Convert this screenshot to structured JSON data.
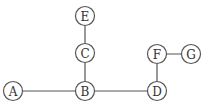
{
  "diagram": {
    "type": "graph",
    "node_radius": 9.5,
    "colors": {
      "stroke": "#555555",
      "text": "#333333",
      "background": "#ffffff"
    },
    "nodes": [
      {
        "id": "E",
        "label": "E",
        "x": 85,
        "y": 16
      },
      {
        "id": "C",
        "label": "C",
        "x": 85,
        "y": 53
      },
      {
        "id": "A",
        "label": "A",
        "x": 13,
        "y": 91
      },
      {
        "id": "B",
        "label": "B",
        "x": 85,
        "y": 91
      },
      {
        "id": "D",
        "label": "D",
        "x": 157,
        "y": 91
      },
      {
        "id": "F",
        "label": "F",
        "x": 157,
        "y": 54
      },
      {
        "id": "G",
        "label": "G",
        "x": 191,
        "y": 54
      }
    ],
    "edges": [
      {
        "from": "E",
        "to": "C"
      },
      {
        "from": "C",
        "to": "B"
      },
      {
        "from": "A",
        "to": "B"
      },
      {
        "from": "B",
        "to": "D"
      },
      {
        "from": "D",
        "to": "F"
      },
      {
        "from": "F",
        "to": "G"
      }
    ]
  }
}
